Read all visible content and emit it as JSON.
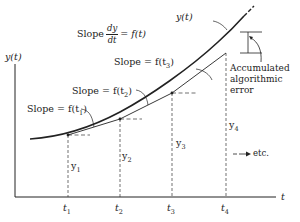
{
  "axes": {
    "y_label": "y(t)",
    "x_label": "t",
    "t_ticks": [
      "t",
      "t",
      "t",
      "t"
    ],
    "t_subscripts": [
      "1",
      "2",
      "3",
      "4"
    ]
  },
  "labels": {
    "slope_main_prefix": "Slope",
    "slope_main_num": "dy",
    "slope_main_den": "dt",
    "slope_main_suffix": "= f(t)",
    "curve_label": "y(t)",
    "slope_t1": "Slope = f(t",
    "slope_t2": "Slope = f(t",
    "slope_t3": "Slope = f(t",
    "sub1": "1",
    "sub2": "2",
    "sub3": "3",
    "close_paren": ")",
    "y_values": [
      "y",
      "y",
      "y",
      "y"
    ],
    "y_subscripts": [
      "1",
      "2",
      "3",
      "4"
    ],
    "error_note": [
      "Accumulated",
      "algorithmic",
      "error"
    ],
    "etc": "etc."
  },
  "colors": {
    "ink": "#222222",
    "background": "#ffffff"
  }
}
